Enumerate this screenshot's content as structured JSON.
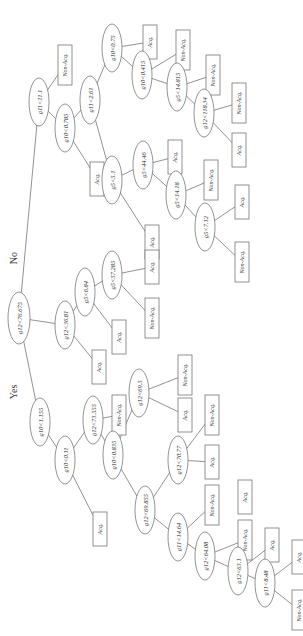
{
  "diagram": {
    "type": "decision-tree",
    "orientation": "rotated-90-clockwise",
    "branch_labels": {
      "yes": "Yes",
      "no": "No"
    },
    "colors": {
      "stroke": "#777777",
      "text": "#333333",
      "background": "#ffffff"
    },
    "nodes": [
      {
        "id": "root",
        "kind": "split",
        "label": "g12<76.675",
        "x": 19,
        "y": 318,
        "rx": 11,
        "ry": 26
      },
      {
        "id": "n1",
        "kind": "split",
        "label": "g11<11.1",
        "x": 39,
        "y": 102,
        "rx": 10,
        "ry": 24
      },
      {
        "id": "l1",
        "kind": "leaf",
        "label": "Non-Acq.",
        "x": 58,
        "y": 45,
        "w": 14,
        "h": 40
      },
      {
        "id": "n2",
        "kind": "split",
        "label": "g10<0.785",
        "x": 65,
        "y": 128,
        "rx": 10,
        "ry": 24
      },
      {
        "id": "n3",
        "kind": "split",
        "label": "g11<2.61",
        "x": 90,
        "y": 100,
        "rx": 10,
        "ry": 24
      },
      {
        "id": "l2",
        "kind": "leaf",
        "label": "Acq.",
        "x": 90,
        "y": 162,
        "w": 14,
        "h": 34
      },
      {
        "id": "n4",
        "kind": "split",
        "label": "g10<0.75",
        "x": 112,
        "y": 48,
        "rx": 10,
        "ry": 24
      },
      {
        "id": "l3",
        "kind": "leaf",
        "label": "Acq.",
        "x": 143,
        "y": 25,
        "w": 14,
        "h": 34
      },
      {
        "id": "n5",
        "kind": "split",
        "label": "g10<0.415",
        "x": 142,
        "y": 75,
        "rx": 10,
        "ry": 24
      },
      {
        "id": "l4",
        "kind": "leaf",
        "label": "Non-Acq.",
        "x": 176,
        "y": 30,
        "w": 14,
        "h": 40
      },
      {
        "id": "n6",
        "kind": "split",
        "label": "g5<14.815",
        "x": 177,
        "y": 87,
        "rx": 10,
        "ry": 24
      },
      {
        "id": "l5",
        "kind": "leaf",
        "label": "Non-Acq.",
        "x": 206,
        "y": 55,
        "w": 14,
        "h": 40
      },
      {
        "id": "n7",
        "kind": "split",
        "label": "g12<118.34",
        "x": 204,
        "y": 113,
        "rx": 10,
        "ry": 24
      },
      {
        "id": "l6",
        "kind": "leaf",
        "label": "Non-Acq.",
        "x": 232,
        "y": 83,
        "w": 14,
        "h": 40
      },
      {
        "id": "l7",
        "kind": "leaf",
        "label": "Acq.",
        "x": 232,
        "y": 133,
        "w": 14,
        "h": 34
      },
      {
        "id": "n8",
        "kind": "split",
        "label": "g5<5.1",
        "x": 112,
        "y": 180,
        "rx": 10,
        "ry": 24
      },
      {
        "id": "n9",
        "kind": "split",
        "label": "g5<44.46",
        "x": 143,
        "y": 165,
        "rx": 10,
        "ry": 24
      },
      {
        "id": "l8",
        "kind": "leaf",
        "label": "Acq.",
        "x": 168,
        "y": 140,
        "w": 14,
        "h": 34
      },
      {
        "id": "l9",
        "kind": "leaf",
        "label": "Acq.",
        "x": 145,
        "y": 225,
        "w": 14,
        "h": 34
      },
      {
        "id": "n10",
        "kind": "split",
        "label": "g5<14.18",
        "x": 176,
        "y": 195,
        "rx": 10,
        "ry": 24
      },
      {
        "id": "l10",
        "kind": "leaf",
        "label": "Non-Acq.",
        "x": 204,
        "y": 160,
        "w": 14,
        "h": 40
      },
      {
        "id": "n11",
        "kind": "split",
        "label": "g5<7.12",
        "x": 205,
        "y": 227,
        "rx": 10,
        "ry": 24
      },
      {
        "id": "l11",
        "kind": "leaf",
        "label": "Acq.",
        "x": 235,
        "y": 185,
        "w": 14,
        "h": 34
      },
      {
        "id": "l12",
        "kind": "leaf",
        "label": "Non-Acq.",
        "x": 235,
        "y": 242,
        "w": 14,
        "h": 40
      },
      {
        "id": "n12",
        "kind": "split",
        "label": "g12<36.81",
        "x": 65,
        "y": 325,
        "rx": 10,
        "ry": 24
      },
      {
        "id": "n13",
        "kind": "split",
        "label": "g5<6.84",
        "x": 85,
        "y": 292,
        "rx": 10,
        "ry": 24
      },
      {
        "id": "l13",
        "kind": "leaf",
        "label": "Acq.",
        "x": 92,
        "y": 350,
        "w": 14,
        "h": 34
      },
      {
        "id": "n14",
        "kind": "split",
        "label": "g5<57.285",
        "x": 112,
        "y": 275,
        "rx": 10,
        "ry": 24
      },
      {
        "id": "l14",
        "kind": "leaf",
        "label": "Acq.",
        "x": 112,
        "y": 320,
        "w": 14,
        "h": 34
      },
      {
        "id": "l15",
        "kind": "leaf",
        "label": "Acq.",
        "x": 145,
        "y": 250,
        "w": 14,
        "h": 34
      },
      {
        "id": "l16",
        "kind": "leaf",
        "label": "Non-Acq.",
        "x": 145,
        "y": 298,
        "w": 14,
        "h": 40
      },
      {
        "id": "n15",
        "kind": "split",
        "label": "g10<1.155",
        "x": 40,
        "y": 422,
        "rx": 10,
        "ry": 24
      },
      {
        "id": "n16",
        "kind": "split",
        "label": "g10<0.11",
        "x": 65,
        "y": 460,
        "rx": 10,
        "ry": 24
      },
      {
        "id": "l17",
        "kind": "leaf",
        "label": "Acq.",
        "x": 93,
        "y": 512,
        "w": 14,
        "h": 34
      },
      {
        "id": "n17",
        "kind": "split",
        "label": "g12<73.555",
        "x": 93,
        "y": 420,
        "rx": 10,
        "ry": 24
      },
      {
        "id": "l18",
        "kind": "leaf",
        "label": "Non-Acq.",
        "x": 112,
        "y": 395,
        "w": 14,
        "h": 40
      },
      {
        "id": "n18",
        "kind": "split",
        "label": "g10<0.835",
        "x": 113,
        "y": 455,
        "rx": 10,
        "ry": 24
      },
      {
        "id": "n19",
        "kind": "split",
        "label": "g12<69.5",
        "x": 139,
        "y": 393,
        "rx": 10,
        "ry": 24
      },
      {
        "id": "l19",
        "kind": "leaf",
        "label": "Non-Acq.",
        "x": 178,
        "y": 355,
        "w": 14,
        "h": 40
      },
      {
        "id": "l20",
        "kind": "leaf",
        "label": "Acq.",
        "x": 178,
        "y": 398,
        "w": 14,
        "h": 34
      },
      {
        "id": "n20",
        "kind": "split",
        "label": "g12<69.855",
        "x": 145,
        "y": 510,
        "rx": 10,
        "ry": 24
      },
      {
        "id": "n21",
        "kind": "split",
        "label": "g12<70.77",
        "x": 178,
        "y": 460,
        "rx": 10,
        "ry": 24
      },
      {
        "id": "l21",
        "kind": "leaf",
        "label": "Non-Acq.",
        "x": 205,
        "y": 395,
        "w": 14,
        "h": 40
      },
      {
        "id": "l22",
        "kind": "leaf",
        "label": "Acq.",
        "x": 205,
        "y": 445,
        "w": 14,
        "h": 34
      },
      {
        "id": "n22",
        "kind": "split",
        "label": "g11<14.64",
        "x": 178,
        "y": 537,
        "rx": 10,
        "ry": 24
      },
      {
        "id": "l23",
        "kind": "leaf",
        "label": "Non-Acq.",
        "x": 205,
        "y": 485,
        "w": 14,
        "h": 40
      },
      {
        "id": "l24",
        "kind": "leaf",
        "label": "Acq.",
        "x": 238,
        "y": 480,
        "w": 14,
        "h": 34
      },
      {
        "id": "n23",
        "kind": "split",
        "label": "g12<64.08",
        "x": 205,
        "y": 556,
        "rx": 10,
        "ry": 24
      },
      {
        "id": "l25",
        "kind": "leaf",
        "label": "Non-Acq.",
        "x": 238,
        "y": 520,
        "w": 14,
        "h": 40
      },
      {
        "id": "n24",
        "kind": "split",
        "label": "g12<63.1",
        "x": 238,
        "y": 571,
        "rx": 10,
        "ry": 24
      },
      {
        "id": "l26",
        "kind": "leaf",
        "label": "Acq.",
        "x": 265,
        "y": 528,
        "w": 14,
        "h": 34
      },
      {
        "id": "n25",
        "kind": "split",
        "label": "g11<8.48",
        "x": 265,
        "y": 583,
        "rx": 10,
        "ry": 24
      },
      {
        "id": "l27",
        "kind": "leaf",
        "label": "Acq.",
        "x": 292,
        "y": 540,
        "w": 14,
        "h": 34
      },
      {
        "id": "l28",
        "kind": "leaf",
        "label": "Non-Acq.",
        "x": 292,
        "y": 590,
        "w": 14,
        "h": 40
      }
    ],
    "edges": [
      [
        "root",
        "n1"
      ],
      [
        "root",
        "n12"
      ],
      [
        "root",
        "n15"
      ],
      [
        "n1",
        "l1"
      ],
      [
        "n1",
        "n2"
      ],
      [
        "n2",
        "n3"
      ],
      [
        "n2",
        "l2"
      ],
      [
        "n3",
        "n4"
      ],
      [
        "n3",
        "n8"
      ],
      [
        "n4",
        "l3"
      ],
      [
        "n4",
        "n5"
      ],
      [
        "n5",
        "l4"
      ],
      [
        "n5",
        "n6"
      ],
      [
        "n6",
        "l5"
      ],
      [
        "n6",
        "n7"
      ],
      [
        "n7",
        "l6"
      ],
      [
        "n7",
        "l7"
      ],
      [
        "n8",
        "n9"
      ],
      [
        "n8",
        "l9"
      ],
      [
        "n9",
        "l8"
      ],
      [
        "n9",
        "n10"
      ],
      [
        "n10",
        "l10"
      ],
      [
        "n10",
        "n11"
      ],
      [
        "n11",
        "l11"
      ],
      [
        "n11",
        "l12"
      ],
      [
        "n12",
        "n13"
      ],
      [
        "n12",
        "l13"
      ],
      [
        "n13",
        "n14"
      ],
      [
        "n13",
        "l14"
      ],
      [
        "n14",
        "l15"
      ],
      [
        "n14",
        "l16"
      ],
      [
        "n15",
        "n16"
      ],
      [
        "n16",
        "n17"
      ],
      [
        "n16",
        "l17"
      ],
      [
        "n17",
        "l18"
      ],
      [
        "n17",
        "n18"
      ],
      [
        "n18",
        "n19"
      ],
      [
        "n18",
        "n20"
      ],
      [
        "n19",
        "l19"
      ],
      [
        "n19",
        "l20"
      ],
      [
        "n20",
        "n21"
      ],
      [
        "n20",
        "n22"
      ],
      [
        "n21",
        "l21"
      ],
      [
        "n21",
        "l22"
      ],
      [
        "n22",
        "l23"
      ],
      [
        "n22",
        "n23"
      ],
      [
        "n23",
        "l25"
      ],
      [
        "n23",
        "n24"
      ],
      [
        "n24",
        "l26"
      ],
      [
        "n24",
        "n25"
      ],
      [
        "n25",
        "l27"
      ],
      [
        "n25",
        "l28"
      ]
    ],
    "branch_label_positions": {
      "no": {
        "x": 17,
        "y": 258
      },
      "yes": {
        "x": 17,
        "y": 392
      }
    }
  }
}
